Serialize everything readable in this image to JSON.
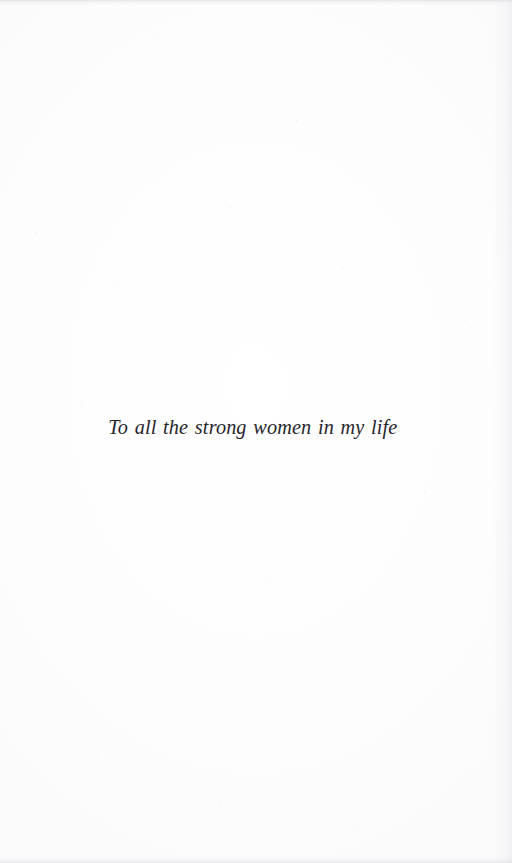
{
  "page": {
    "kind": "book-dedication-page",
    "width": 512,
    "height": 863,
    "background_color": "#fefefe",
    "ink_color": "#26252a"
  },
  "dedication": {
    "text": "To all the strong women in my life"
  }
}
